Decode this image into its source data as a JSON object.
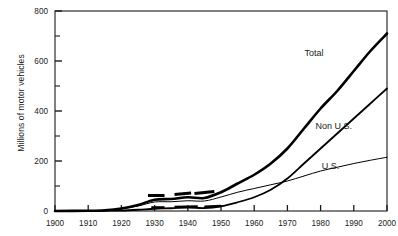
{
  "chart_data": {
    "type": "line",
    "title": "",
    "xlabel": "",
    "ylabel": "Millions of motor vehicles",
    "xlim": [
      1900,
      2000
    ],
    "ylim": [
      0,
      800
    ],
    "grid": false,
    "legend_position": "inline-labels",
    "x_ticks": [
      1900,
      1910,
      1920,
      1930,
      1940,
      1950,
      1960,
      1970,
      1980,
      1990,
      2000
    ],
    "x_tick_labels": [
      "1900",
      "1910",
      "1920",
      "1930",
      "1940",
      "1950",
      "1960",
      "1970",
      "1980",
      "1990",
      "2000"
    ],
    "y_ticks": [
      0,
      100,
      200,
      300,
      400,
      500,
      600,
      700,
      800
    ],
    "y_tick_labels": [
      "0",
      "",
      "200",
      "",
      "400",
      "",
      "600",
      "",
      "800"
    ],
    "y_major_labels": [
      "0",
      "200",
      "400",
      "600",
      "800"
    ],
    "series": [
      {
        "name": "Total",
        "label": "Total",
        "stroke_width": 2.6,
        "color": "#000000",
        "x": [
          1900,
          1910,
          1915,
          1920,
          1925,
          1930,
          1935,
          1940,
          1945,
          1950,
          1955,
          1960,
          1965,
          1970,
          1975,
          1980,
          1985,
          1990,
          1995,
          2000
        ],
        "values": [
          0,
          1,
          3,
          10,
          24,
          45,
          48,
          55,
          52,
          75,
          110,
          145,
          190,
          250,
          330,
          410,
          480,
          560,
          640,
          710
        ]
      },
      {
        "name": "Non U.S.",
        "label": "Non U.S.",
        "stroke_width": 1.8,
        "color": "#000000",
        "x": [
          1900,
          1910,
          1915,
          1920,
          1925,
          1930,
          1935,
          1940,
          1945,
          1950,
          1955,
          1960,
          1965,
          1970,
          1975,
          1980,
          1985,
          1990,
          1995,
          2000
        ],
        "values": [
          0,
          0,
          1,
          2,
          5,
          9,
          11,
          14,
          12,
          19,
          35,
          55,
          85,
          130,
          190,
          250,
          310,
          370,
          430,
          490
        ]
      },
      {
        "name": "U.S.",
        "label": "U.S.",
        "stroke_width": 1.0,
        "color": "#000000",
        "x": [
          1900,
          1910,
          1915,
          1920,
          1925,
          1930,
          1935,
          1940,
          1945,
          1950,
          1955,
          1960,
          1965,
          1970,
          1975,
          1980,
          1985,
          1990,
          1995,
          2000
        ],
        "values": [
          0,
          1,
          2,
          9,
          20,
          36,
          37,
          41,
          40,
          56,
          75,
          90,
          105,
          120,
          140,
          160,
          175,
          190,
          203,
          215
        ]
      }
    ],
    "annotations": [
      {
        "text": "Total",
        "x": 1978,
        "y": 620
      },
      {
        "text": "Non U.S.",
        "x": 1984,
        "y": 330
      },
      {
        "text": "U.S.",
        "x": 1983,
        "y": 170
      }
    ]
  }
}
